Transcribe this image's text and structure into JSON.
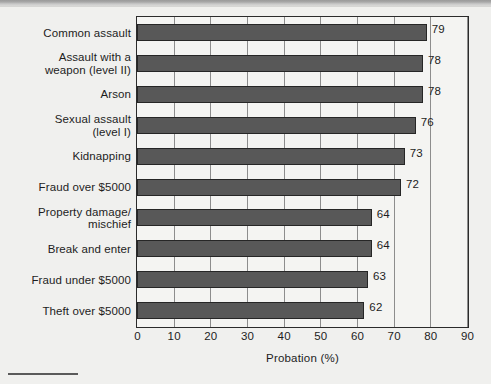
{
  "chart_data": {
    "type": "bar",
    "orientation": "horizontal",
    "title": "",
    "xlabel": "Probation (%)",
    "ylabel": "",
    "xlim": [
      0,
      90
    ],
    "xticks": [
      0,
      10,
      20,
      30,
      40,
      50,
      60,
      70,
      80,
      90
    ],
    "grid": true,
    "legend": "none",
    "categories": [
      "Common assault",
      "Assault with a weapon (level II)",
      "Arson",
      "Sexual assault (level I)",
      "Kidnapping",
      "Fraud over $5000",
      "Property damage/ mischief",
      "Break and enter",
      "Fraud under $5000",
      "Theft over $5000"
    ],
    "category_lines": [
      [
        "Common assault"
      ],
      [
        "Assault with a",
        "weapon (level II)"
      ],
      [
        "Arson"
      ],
      [
        "Sexual assault",
        "(level I)"
      ],
      [
        "Kidnapping"
      ],
      [
        "Fraud over $5000"
      ],
      [
        "Property damage/",
        "mischief"
      ],
      [
        "Break and enter"
      ],
      [
        "Fraud under $5000"
      ],
      [
        "Theft over $5000"
      ]
    ],
    "values": [
      79,
      78,
      78,
      76,
      73,
      72,
      64,
      64,
      63,
      62
    ],
    "value_labels": [
      "79",
      "78",
      "78",
      "76",
      "73",
      "72",
      "64",
      "64",
      "63",
      "62"
    ],
    "bar_color": "#585858",
    "bar_edge_color": "#262626",
    "plot_bg": "#f4f4f2",
    "frame_color": "#2b2b2b",
    "grid_color": "#8d8d8d",
    "figure_bg": "#f0f0ee",
    "text_color": "#1d1d1d"
  }
}
